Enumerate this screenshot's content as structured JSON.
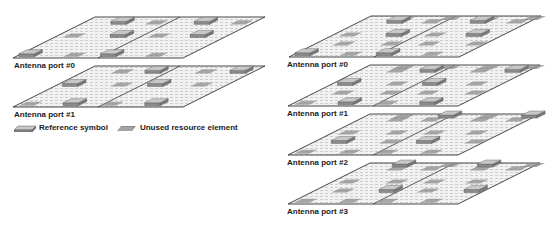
{
  "colors": {
    "plane_fill": "#eeeeee",
    "plane_stroke": "#333333",
    "hatch": "#9a9a9a",
    "rs_top": "#c8c8c8",
    "rs_front": "#8a8a8a",
    "rs_stroke": "#555555",
    "unused": "#8c8c8c",
    "text": "#222222"
  },
  "plane_geometry": {
    "width": 170,
    "depth_dx": 82,
    "depth_dy": 41
  },
  "left_config": {
    "planes": [
      {
        "label": "Antenna port #0",
        "front_x": 13,
        "front_y": 58,
        "label_x": 14,
        "label_y": 61,
        "rs_set": "A",
        "unused_set": "B"
      },
      {
        "label": "Antenna port #1",
        "front_x": 13,
        "front_y": 107,
        "label_x": 14,
        "label_y": 110,
        "rs_set": "B",
        "unused_set": "A"
      }
    ],
    "legend": {
      "reference_symbol": "Reference symbol",
      "unused_resource_element": "Unused resource element"
    }
  },
  "right_config": {
    "planes": [
      {
        "label": "Antenna port #0",
        "front_x": 289,
        "front_y": 57,
        "label_x": 287,
        "label_y": 60,
        "rs_set": "A",
        "unused_set": "BCD"
      },
      {
        "label": "Antenna port #1",
        "front_x": 288,
        "front_y": 106,
        "label_x": 287,
        "label_y": 109,
        "rs_set": "B",
        "unused_set": "ACD"
      },
      {
        "label": "Antenna port #2",
        "front_x": 288,
        "front_y": 155,
        "label_x": 287,
        "label_y": 158,
        "rs_set": "C",
        "unused_set": "ABD"
      },
      {
        "label": "Antenna port #3",
        "front_x": 288,
        "front_y": 204,
        "label_x": 287,
        "label_y": 207,
        "rs_set": "D",
        "unused_set": "ABC"
      }
    ]
  },
  "rs_positions": {
    "A": [
      [
        0.02,
        0.03
      ],
      [
        0.5,
        0.03
      ],
      [
        0.33,
        0.5
      ],
      [
        0.8,
        0.5
      ],
      [
        0.18,
        0.82
      ],
      [
        0.67,
        0.82
      ]
    ],
    "B": [
      [
        0.28,
        0.03
      ],
      [
        0.76,
        0.03
      ],
      [
        0.05,
        0.5
      ],
      [
        0.55,
        0.5
      ],
      [
        0.38,
        0.82
      ],
      [
        0.88,
        0.82
      ]
    ],
    "C": [
      [
        0.12,
        0.28
      ],
      [
        0.62,
        0.28
      ],
      [
        0.45,
        0.9
      ],
      [
        0.94,
        0.9
      ]
    ],
    "D": [
      [
        0.4,
        0.28
      ],
      [
        0.9,
        0.28
      ],
      [
        0.18,
        0.9
      ],
      [
        0.68,
        0.9
      ]
    ]
  }
}
